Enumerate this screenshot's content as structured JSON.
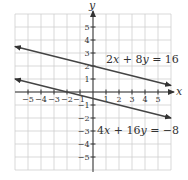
{
  "chart_data": {
    "type": "line",
    "title": "",
    "xlabel": "x",
    "ylabel": "y",
    "xlim": [
      -6,
      6
    ],
    "ylim": [
      -6,
      6
    ],
    "grid": true,
    "x_ticks": [
      -5,
      -4,
      -3,
      -2,
      -1,
      1,
      2,
      3,
      4,
      5
    ],
    "y_ticks": [
      5,
      4,
      3,
      2,
      1,
      -1,
      -2,
      -3,
      -4,
      -5
    ],
    "x_tick_labels": [
      "−5",
      "−4",
      "−3",
      "−2",
      "−1",
      "1",
      "2",
      "3",
      "4",
      "5"
    ],
    "y_tick_labels": [
      "5",
      "4",
      "3",
      "2",
      "1",
      "−1",
      "−2",
      "−3",
      "−4",
      "−5"
    ],
    "series": [
      {
        "name": "2x + 8y = 16",
        "equation": "2x + 8y = 16",
        "slope": -0.25,
        "intercept": 2,
        "x": [
          -6,
          6
        ],
        "y": [
          3.5,
          0.5
        ],
        "arrows": "both",
        "color": "#444444",
        "label_position": {
          "x": 0.9,
          "y": 2.3
        }
      },
      {
        "name": "4x + 16y = −8",
        "equation": "4x + 16y = −8",
        "slope": -0.25,
        "intercept": -0.5,
        "x": [
          -6,
          6
        ],
        "y": [
          1,
          -2
        ],
        "arrows": "both",
        "color": "#444444",
        "label_position": {
          "x": 0.3,
          "y": -3.2
        }
      }
    ],
    "annotations": [
      "2x + 8y = 16",
      "4x + 16y = −8"
    ]
  },
  "labels": {
    "x_axis": "x",
    "y_axis": "y",
    "eq1": {
      "a": "2",
      "v1": "x",
      "op": " + ",
      "b": "8",
      "v2": "y",
      "rhs": " = 16"
    },
    "eq2": {
      "a": "4",
      "v1": "x",
      "op": " + ",
      "b": "16",
      "v2": "y",
      "rhs": " = −8"
    }
  },
  "colors": {
    "line": "#444444",
    "axis": "#333333",
    "grid": "#cfcfcf"
  }
}
